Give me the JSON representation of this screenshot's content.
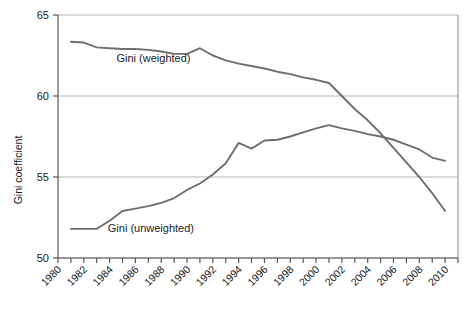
{
  "chart_data": {
    "type": "line",
    "title": "",
    "xlabel": "",
    "ylabel": "Gini coefficient",
    "xlim": [
      1980,
      2011
    ],
    "ylim": [
      50,
      65
    ],
    "yticks": [
      50,
      55,
      60,
      65
    ],
    "ytick_labels": [
      "50",
      "55",
      "60",
      "65"
    ],
    "xticks": [
      1980,
      1981,
      1982,
      1983,
      1984,
      1985,
      1986,
      1987,
      1988,
      1989,
      1990,
      1991,
      1992,
      1993,
      1994,
      1995,
      1996,
      1997,
      1998,
      1999,
      2000,
      2001,
      2002,
      2003,
      2004,
      2005,
      2006,
      2007,
      2008,
      2009,
      2010,
      2011
    ],
    "xtick_labels": [
      "1980",
      "1982",
      "1984",
      "1986",
      "1988",
      "1990",
      "1992",
      "1994",
      "1996",
      "1998",
      "2000",
      "2002",
      "2004",
      "2006",
      "2008",
      "2010"
    ],
    "xtick_label_values": [
      1980,
      1982,
      1984,
      1986,
      1988,
      1990,
      1992,
      1994,
      1996,
      1998,
      2000,
      2002,
      2004,
      2006,
      2008,
      2010
    ],
    "grid": "horizontal",
    "legend_position": "inline-annotation",
    "line_color": "#6e6e6e",
    "grid_color": "#b5b5b5",
    "axis_color": "#555555",
    "background": "#ffffff",
    "x": [
      1981,
      1982,
      1983,
      1984,
      1985,
      1986,
      1987,
      1988,
      1989,
      1990,
      1991,
      1992,
      1993,
      1994,
      1995,
      1996,
      1997,
      1998,
      1999,
      2000,
      2001,
      2002,
      2003,
      2004,
      2005,
      2006,
      2007,
      2008,
      2009,
      2010
    ],
    "series": [
      {
        "name": "Gini (weighted)",
        "label": "Gini (weighted)",
        "label_x": 1987.4,
        "label_y": 62.1,
        "color": "#6e6e6e",
        "values": [
          63.35,
          63.3,
          63.0,
          62.95,
          62.9,
          62.9,
          62.85,
          62.75,
          62.6,
          62.6,
          62.95,
          62.5,
          62.2,
          62.0,
          61.85,
          61.7,
          61.5,
          61.35,
          61.15,
          61.0,
          60.8,
          60.0,
          59.2,
          58.5,
          57.7,
          56.8,
          55.9,
          55.0,
          54.0,
          52.9
        ]
      },
      {
        "name": "Gini (unweighted)",
        "label": "Gini (unweighted)",
        "label_x": 1987.2,
        "label_y": 51.6,
        "color": "#6e6e6e",
        "values": [
          51.8,
          51.8,
          51.8,
          52.3,
          52.9,
          53.05,
          53.2,
          53.4,
          53.7,
          54.2,
          54.6,
          55.15,
          55.85,
          57.1,
          56.75,
          57.25,
          57.3,
          57.5,
          57.75,
          58.0,
          58.2,
          58.0,
          57.85,
          57.65,
          57.5,
          57.3,
          57.0,
          56.7,
          56.2,
          56.0
        ]
      }
    ]
  },
  "axis": {
    "y_title": "Gini coefficient"
  }
}
